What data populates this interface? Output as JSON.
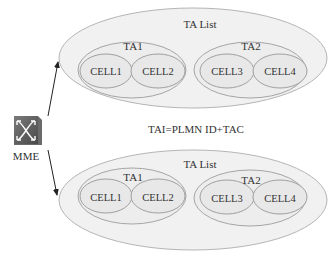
{
  "mme": {
    "label": "MME",
    "icon": "router-switch-icon"
  },
  "formula": "TAI=PLMN  ID+TAC",
  "groups": [
    {
      "label": "TA List",
      "areas": [
        {
          "label": "TA1",
          "cells": [
            "CELL1",
            "CELL2"
          ]
        },
        {
          "label": "TA2",
          "cells": [
            "CELL3",
            "CELL4"
          ]
        }
      ]
    },
    {
      "label": "TA List",
      "areas": [
        {
          "label": "TA1",
          "cells": [
            "CELL1",
            "CELL2"
          ]
        },
        {
          "label": "TA2",
          "cells": [
            "CELL3",
            "CELL4"
          ]
        }
      ]
    }
  ],
  "colors": {
    "outer_fill": "#f0f0f0",
    "stroke": "#9a9a9a",
    "icon": "#5a5a5a"
  }
}
